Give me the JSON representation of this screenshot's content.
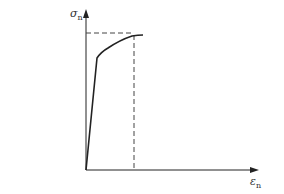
{
  "diagram": {
    "type": "stress-strain curve",
    "y_axis": {
      "symbol": "σ",
      "subscript": "n"
    },
    "x_axis": {
      "symbol": "ε",
      "subscript": "n"
    },
    "colors": {
      "line": "#222222",
      "dash": "#444444",
      "background": "#ffffff"
    },
    "curve": {
      "points": [
        [
          86,
          170
        ],
        [
          97,
          58
        ],
        [
          105,
          50
        ],
        [
          118,
          42
        ],
        [
          132,
          36
        ],
        [
          143,
          35
        ]
      ],
      "description": "linear elastic rise then work-hardening curve to peak"
    },
    "guides": {
      "horizontal_dashed_at_peak": true,
      "vertical_dashed_at_peak": true
    }
  },
  "footer": {
    "caption_fragment": ""
  }
}
